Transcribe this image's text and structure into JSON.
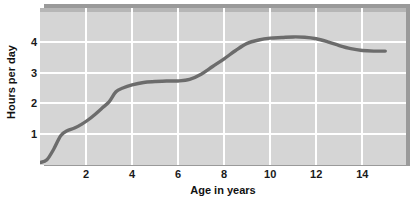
{
  "chart_data": {
    "type": "line",
    "title": "",
    "xlabel": "Age in years",
    "ylabel": "Hours per day",
    "xlim": [
      0,
      15.9
    ],
    "ylim": [
      0,
      5.1
    ],
    "xticks": [
      2,
      4,
      6,
      8,
      10,
      12,
      14
    ],
    "xtick_labels": [
      "2",
      "4",
      "6",
      "8",
      "10",
      "12",
      "14"
    ],
    "yticks": [
      1,
      2,
      3,
      4
    ],
    "ytick_labels": [
      "1",
      "2",
      "3",
      "4"
    ],
    "grid": true,
    "legend": "none",
    "series": [
      {
        "name": "Hours per day",
        "x": [
          0.0,
          0.3,
          0.6,
          0.9,
          1.2,
          1.5,
          1.8,
          2.1,
          2.4,
          2.7,
          3.0,
          3.3,
          3.6,
          4.0,
          4.5,
          5.0,
          5.5,
          6.0,
          6.5,
          7.0,
          7.5,
          8.0,
          8.5,
          9.0,
          9.5,
          10.0,
          10.5,
          11.0,
          11.5,
          12.0,
          12.5,
          13.0,
          13.5,
          14.0,
          14.5,
          15.0
        ],
        "y": [
          0.08,
          0.17,
          0.52,
          0.95,
          1.12,
          1.2,
          1.32,
          1.47,
          1.65,
          1.85,
          2.05,
          2.38,
          2.5,
          2.6,
          2.68,
          2.71,
          2.73,
          2.73,
          2.78,
          2.95,
          3.2,
          3.45,
          3.72,
          3.95,
          4.06,
          4.12,
          4.14,
          4.16,
          4.15,
          4.1,
          4.0,
          3.88,
          3.78,
          3.72,
          3.7,
          3.7
        ]
      }
    ],
    "colors": {
      "line": "#6c6c6c",
      "panel_background": "#d5d5d5",
      "gridline": "#ffffff",
      "shadow": "#9a9a9a",
      "text": "#111111"
    }
  }
}
